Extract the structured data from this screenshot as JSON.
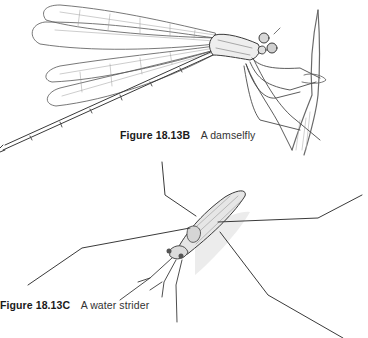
{
  "figures": [
    {
      "number": "Figure 18.13B",
      "text": "A damselfly",
      "illustration": "damselfly-illustration"
    },
    {
      "number": "Figure 18.13C",
      "text": "A water strider",
      "illustration": "water-strider-illustration"
    }
  ],
  "colors": {
    "background": "#ffffff",
    "line": "#3a3a3a",
    "shade": "#9a9a9a",
    "caption": "#1a1a1a"
  }
}
